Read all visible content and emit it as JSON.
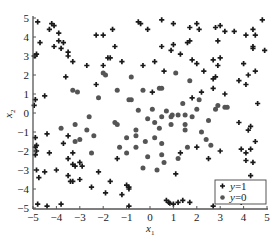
{
  "chart_data": {
    "type": "scatter",
    "title": "",
    "xlabel": "x1",
    "ylabel": "x2",
    "xlim": [
      -5,
      5
    ],
    "ylim": [
      -5,
      5
    ],
    "xticks": [
      -5,
      -4,
      -3,
      -2,
      -1,
      0,
      1,
      2,
      3,
      4,
      5
    ],
    "yticks": [
      -5,
      -4,
      -3,
      -2,
      -1,
      0,
      1,
      2,
      3,
      4,
      5
    ],
    "grid": false,
    "legend_position": "lower right",
    "series": [
      {
        "name": "y=1",
        "marker": "plus",
        "color": "#1a1a1a",
        "points": [
          [
            -4.8,
            4.8
          ],
          [
            -4.3,
            4.4
          ],
          [
            -4.2,
            4.7
          ],
          [
            -4.1,
            4.6
          ],
          [
            -3.9,
            4.2
          ],
          [
            -4.7,
            3.7
          ],
          [
            -4.1,
            3.5
          ],
          [
            -3.9,
            3.8
          ],
          [
            -3.8,
            3.4
          ],
          [
            -3.7,
            3.7
          ],
          [
            -3.5,
            3.2
          ],
          [
            -3.5,
            3.0
          ],
          [
            -4.95,
            3.0
          ],
          [
            -4.9,
            3.0
          ],
          [
            -4.85,
            3.1
          ],
          [
            -3.3,
            2.7
          ],
          [
            -2.7,
            2.5
          ],
          [
            -2.3,
            1.5
          ],
          [
            -2.0,
            2.5
          ],
          [
            -1.8,
            2.9
          ],
          [
            -1.7,
            2.9
          ],
          [
            -1.5,
            3.5
          ],
          [
            -1.6,
            4.4
          ],
          [
            -2.0,
            4.1
          ],
          [
            -2.3,
            4.1
          ],
          [
            -1.2,
            2.7
          ],
          [
            -0.5,
            4.8
          ],
          [
            -0.4,
            4.7
          ],
          [
            -0.3,
            2.5
          ],
          [
            -0.1,
            4.4
          ],
          [
            0.2,
            2.7
          ],
          [
            0.5,
            3.5
          ],
          [
            -3.6,
            1.9
          ],
          [
            -4.5,
            0.9
          ],
          [
            -4.9,
            0.7
          ],
          [
            -4.95,
            0.4
          ],
          [
            -4.9,
            -1.3
          ],
          [
            -4.85,
            -1.7
          ],
          [
            -4.9,
            -1.8
          ],
          [
            -4.4,
            -1.1
          ],
          [
            -4.85,
            -2.0
          ],
          [
            -4.9,
            -2.2
          ],
          [
            -4.3,
            -2.1
          ],
          [
            -3.7,
            -1.6
          ],
          [
            -3.5,
            -1.2
          ],
          [
            -3.5,
            -2.4
          ],
          [
            -3.3,
            -2.7
          ],
          [
            -3.2,
            -2.8
          ],
          [
            -3.0,
            -2.6
          ],
          [
            -2.9,
            -2.8
          ],
          [
            -3.3,
            -2.1
          ],
          [
            -4.85,
            -3.0
          ],
          [
            -4.75,
            -3.4
          ],
          [
            -4.5,
            -3.1
          ],
          [
            -4.0,
            -3.0
          ],
          [
            -3.5,
            -3.3
          ],
          [
            -3.4,
            -3.6
          ],
          [
            -3.3,
            -3.6
          ],
          [
            -2.2,
            -3.1
          ],
          [
            -1.7,
            -3.6
          ],
          [
            -2.5,
            -3.9
          ],
          [
            -1.9,
            -4.2
          ],
          [
            -3.0,
            -3.5
          ],
          [
            -1.4,
            -2.4
          ],
          [
            -4.8,
            -4.8
          ],
          [
            -4.4,
            -4.9
          ],
          [
            -3.8,
            -4.8
          ],
          [
            -0.9,
            -4.9
          ],
          [
            -1.2,
            -4.3
          ],
          [
            -1.0,
            -3.8
          ],
          [
            -0.9,
            -3.9
          ],
          [
            -0.9,
            -4.0
          ],
          [
            0.7,
            -4.6
          ],
          [
            0.8,
            -4.7
          ],
          [
            0.85,
            -4.75
          ],
          [
            1.0,
            -4.8
          ],
          [
            1.2,
            -4.7
          ],
          [
            1.4,
            -4.6
          ],
          [
            1.7,
            -4.7
          ],
          [
            1.1,
            -3.2
          ],
          [
            2.0,
            -1.8
          ],
          [
            2.5,
            -2.4
          ],
          [
            2.7,
            -4.9
          ],
          [
            3.4,
            -4.6
          ],
          [
            3.5,
            -4.65
          ],
          [
            3.9,
            -4.7
          ],
          [
            4.3,
            -4.6
          ],
          [
            3.0,
            -2.0
          ],
          [
            3.9,
            -1.9
          ],
          [
            4.1,
            -2.1
          ],
          [
            4.3,
            -1.9
          ],
          [
            4.5,
            -1.5
          ],
          [
            4.1,
            -2.5
          ],
          [
            4.4,
            -2.6
          ],
          [
            4.3,
            -3.3
          ],
          [
            4.6,
            -3.7
          ],
          [
            4.8,
            -3.9
          ],
          [
            4.2,
            -0.9
          ],
          [
            4.3,
            -0.7
          ],
          [
            3.8,
            -0.5
          ],
          [
            4.6,
            0.5
          ],
          [
            4.1,
            1.5
          ],
          [
            4.5,
            2.2
          ],
          [
            4.2,
            2.0
          ],
          [
            4.0,
            2.6
          ],
          [
            3.8,
            1.7
          ],
          [
            2.9,
            2.5
          ],
          [
            2.7,
            1.8
          ],
          [
            3.2,
            1.0
          ],
          [
            2.8,
            1.9
          ],
          [
            2.2,
            1.1
          ],
          [
            1.8,
            0.8
          ],
          [
            4.4,
            3.4
          ],
          [
            4.4,
            3.5
          ],
          [
            4.9,
            3.3
          ],
          [
            4.5,
            4.1
          ],
          [
            4.1,
            4.1
          ],
          [
            4.4,
            4.4
          ],
          [
            3.6,
            4.3
          ],
          [
            3.2,
            4.3
          ],
          [
            3.0,
            4.6
          ],
          [
            4.8,
            4.9
          ],
          [
            2.8,
            4.5
          ],
          [
            1.7,
            4.5
          ],
          [
            2.0,
            4.7
          ],
          [
            2.1,
            4.4
          ],
          [
            1.0,
            4.7
          ],
          [
            0.5,
            4.9
          ],
          [
            1.0,
            3.6
          ],
          [
            0.9,
            3.3
          ],
          [
            1.6,
            3.7
          ],
          [
            1.7,
            3.8
          ],
          [
            1.3,
            3.1
          ],
          [
            1.8,
            2.8
          ],
          [
            2.0,
            2.6
          ],
          [
            2.3,
            2.2
          ],
          [
            0.6,
            2.2
          ],
          [
            2.9,
            3.8
          ],
          [
            2.7,
            2.8
          ],
          [
            3.0,
            2.9
          ],
          [
            2.7,
            1.3
          ],
          [
            0.1,
            1.1
          ],
          [
            1.3,
            -2.1
          ]
        ]
      },
      {
        "name": "y=0",
        "marker": "circle",
        "color": "#555555",
        "points": [
          [
            -2.0,
            2.1
          ],
          [
            -1.9,
            2.0
          ],
          [
            -0.8,
            1.9
          ],
          [
            -1.4,
            1.2
          ],
          [
            -3.3,
            1.2
          ],
          [
            -3.1,
            1.1
          ],
          [
            -2.2,
            0.8
          ],
          [
            -0.9,
            0.7
          ],
          [
            -0.8,
            0.7
          ],
          [
            -0.3,
            1.2
          ],
          [
            0.4,
            1.3
          ],
          [
            0.5,
            1.3
          ],
          [
            1.1,
            2.1
          ],
          [
            1.7,
            1.7
          ],
          [
            2.1,
            0.7
          ],
          [
            -0.5,
            0.15
          ],
          [
            0.1,
            0.2
          ],
          [
            0.7,
            0.1
          ],
          [
            0.9,
            -0.2
          ],
          [
            0.95,
            -0.1
          ],
          [
            1.2,
            -0.1
          ],
          [
            1.5,
            -0.1
          ],
          [
            1.8,
            -0.2
          ],
          [
            -0.1,
            -0.3
          ],
          [
            0.2,
            -0.5
          ],
          [
            0.5,
            -0.2
          ],
          [
            1.4,
            0.5
          ],
          [
            2.0,
            0.2
          ],
          [
            2.8,
            0.2
          ],
          [
            2.9,
            0.4
          ],
          [
            3.2,
            0.3
          ],
          [
            3.3,
            0.3
          ],
          [
            1.5,
            -0.6
          ],
          [
            2.5,
            -0.4
          ],
          [
            2.2,
            -1.0
          ],
          [
            2.4,
            -1.4
          ],
          [
            2.6,
            -1.7
          ],
          [
            1.6,
            -1.8
          ],
          [
            -1.0,
            -2.1
          ],
          [
            -0.6,
            -1.8
          ],
          [
            0.5,
            -1.6
          ],
          [
            0.2,
            -1.3
          ],
          [
            -0.6,
            -0.9
          ],
          [
            -1.5,
            -0.5
          ],
          [
            -1.4,
            -0.6
          ],
          [
            -2.6,
            -0.2
          ],
          [
            -3.2,
            -0.6
          ],
          [
            -2.4,
            -1.2
          ],
          [
            -3.2,
            -1.5
          ],
          [
            -2.5,
            -2.1
          ],
          [
            -1.3,
            -1.8
          ],
          [
            -0.6,
            -1.2
          ],
          [
            -0.2,
            -1.5
          ],
          [
            0.4,
            -0.8
          ],
          [
            0.9,
            -0.6
          ],
          [
            -0.1,
            -2.3
          ],
          [
            0.6,
            -2.6
          ],
          [
            0.5,
            -2.2
          ],
          [
            1.2,
            -2.4
          ],
          [
            0.3,
            -3.0
          ],
          [
            -0.3,
            -2.9
          ],
          [
            1.5,
            -0.9
          ],
          [
            -1.0,
            -1.3
          ],
          [
            -2.7,
            -0.9
          ],
          [
            -3.0,
            -1.4
          ],
          [
            -3.8,
            -0.8
          ]
        ]
      }
    ]
  },
  "axes": {
    "xlabel_main": "x",
    "xlabel_sub": "1",
    "ylabel_main": "x",
    "ylabel_sub": "2",
    "xtick_labels": [
      "−5",
      "−4",
      "−3",
      "−2",
      "−1",
      "0",
      "1",
      "2",
      "3",
      "4",
      "5"
    ],
    "ytick_labels": [
      "5",
      "4",
      "3",
      "2",
      "1",
      "0",
      "−1",
      "−2",
      "−3",
      "−4",
      "−5"
    ]
  },
  "legend": {
    "items": [
      {
        "var": "y",
        "eq": "=1",
        "marker": "plus"
      },
      {
        "var": "y",
        "eq": "=0",
        "marker": "circle"
      }
    ]
  }
}
